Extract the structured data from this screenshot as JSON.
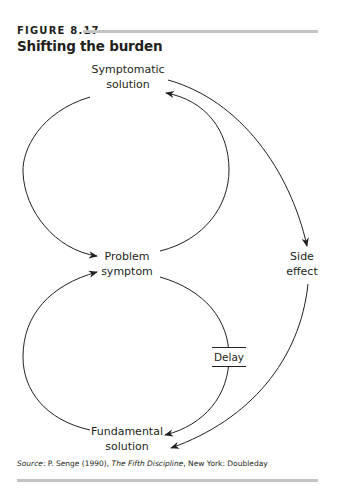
{
  "figure": {
    "label": "FIGURE 8.17",
    "title": "Shifting the burden"
  },
  "diagram": {
    "nodes": {
      "symptomatic_solution": {
        "line1": "Symptomatic",
        "line2": "solution"
      },
      "problem_symptom": {
        "line1": "Problem",
        "line2": "symptom"
      },
      "side_effect": {
        "line1": "Side",
        "line2": "effect"
      },
      "fundamental_solution": {
        "line1": "Fundamental",
        "line2": "solution"
      }
    },
    "delay_label": "Delay",
    "links": [
      {
        "from": "Symptomatic solution",
        "to": "Problem symptom"
      },
      {
        "from": "Problem symptom",
        "to": "Symptomatic solution"
      },
      {
        "from": "Symptomatic solution",
        "to": "Side effect"
      },
      {
        "from": "Side effect",
        "to": "Fundamental solution"
      },
      {
        "from": "Problem symptom",
        "to": "Fundamental solution",
        "delay": true
      },
      {
        "from": "Fundamental solution",
        "to": "Problem symptom"
      }
    ],
    "colors": {
      "stroke": "#231f20",
      "rule": "#c4c4c4"
    }
  },
  "source": {
    "prefix": "Source",
    "text_before": ": P. Senge (1990), ",
    "book": "The Fifth Discipline",
    "text_after": ", New York: Doubleday"
  }
}
